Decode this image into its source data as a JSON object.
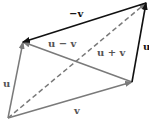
{
  "diagram": {
    "points": {
      "O": [
        8,
        118
      ],
      "A": [
        23,
        42
      ],
      "B": [
        132,
        82
      ],
      "C": [
        146,
        3
      ]
    },
    "colors": {
      "gray": "#7a7a7a",
      "black": "#111111"
    },
    "vectors": [
      {
        "id": "u_left",
        "from": "O",
        "to": "A",
        "color": "gray",
        "dashed": false,
        "label": "u",
        "label_pos": [
          3,
          79
        ]
      },
      {
        "id": "v_bottom",
        "from": "O",
        "to": "B",
        "color": "gray",
        "dashed": false,
        "label": "v",
        "label_pos": [
          74,
          106
        ]
      },
      {
        "id": "u_plus_v",
        "from": "O",
        "to": "C",
        "color": "gray",
        "dashed": true,
        "label": "u + v",
        "label_pos": [
          97,
          48
        ]
      },
      {
        "id": "u_minus_v",
        "from": "B",
        "to": "A",
        "color": "gray",
        "dashed": false,
        "label": "u − v",
        "label_pos": [
          48,
          39
        ]
      },
      {
        "id": "neg_v",
        "from": "C",
        "to": "A",
        "color": "black",
        "dashed": false,
        "label": "−v",
        "label_pos": [
          69,
          9
        ]
      },
      {
        "id": "u_right",
        "from": "B",
        "to": "C",
        "color": "black",
        "dashed": false,
        "label": "u",
        "label_pos": [
          143,
          42
        ]
      }
    ]
  },
  "labels": {
    "u_left": "u",
    "v_bottom": "v",
    "u_plus_v": "u + v",
    "u_minus_v": "u − v",
    "neg_v": "−v",
    "u_right": "u"
  }
}
